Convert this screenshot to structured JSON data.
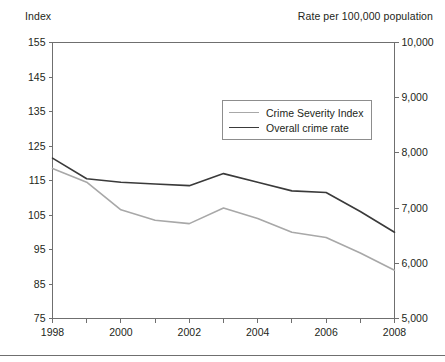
{
  "chart_data": {
    "type": "line",
    "title": "",
    "left_axis_title": "Index",
    "right_axis_title": "Rate per 100,000 population",
    "xlabel": "",
    "x": [
      1998,
      1999,
      2000,
      2001,
      2002,
      2003,
      2004,
      2005,
      2006,
      2007,
      2008
    ],
    "xlim": [
      1998,
      2008
    ],
    "xtick_values": [
      1998,
      1999,
      2000,
      2001,
      2002,
      2003,
      2004,
      2005,
      2006,
      2007,
      2008
    ],
    "xtick_labels": [
      "1998",
      "",
      "2000",
      "",
      "2002",
      "",
      "2004",
      "",
      "2006",
      "",
      "2008"
    ],
    "xticks_labeled": [
      "1998",
      "2000",
      "2002",
      "2004",
      "2006",
      "2008"
    ],
    "ylim": [
      75,
      155
    ],
    "yticks": [
      75,
      85,
      95,
      105,
      115,
      125,
      135,
      145,
      155
    ],
    "ytick_labels": [
      "75",
      "85",
      "95",
      "105",
      "115",
      "125",
      "135",
      "145",
      "155"
    ],
    "y2lim": [
      5000,
      10000
    ],
    "y2ticks": [
      5000,
      6000,
      7000,
      8000,
      9000,
      10000
    ],
    "y2tick_labels": [
      "5,000",
      "6,000",
      "7,000",
      "8,000",
      "9,000",
      "10,000"
    ],
    "grid": false,
    "legend_position": "upper center",
    "series": [
      {
        "name": "Crime Severity Index",
        "axis": "left",
        "color": "#a8a8a8",
        "values": [
          118.5,
          114.5,
          106.5,
          103.5,
          102.5,
          107.0,
          104.0,
          100.0,
          98.5,
          94.0,
          89.0
        ]
      },
      {
        "name": "Overall crime rate",
        "axis": "left",
        "color": "#3a3a3a",
        "values": [
          121.5,
          115.5,
          114.5,
          114.0,
          113.5,
          117.0,
          114.5,
          112.0,
          111.5,
          106.0,
          100.0
        ]
      }
    ]
  },
  "legend": {
    "items": [
      {
        "label": "Crime Severity Index"
      },
      {
        "label": "Overall crime rate"
      }
    ]
  },
  "colors": {
    "axis": "#6f6f6f",
    "text": "#231f20",
    "series_light": "#a8a8a8",
    "series_dark": "#3a3a3a",
    "rule": "#6f6f6f"
  }
}
